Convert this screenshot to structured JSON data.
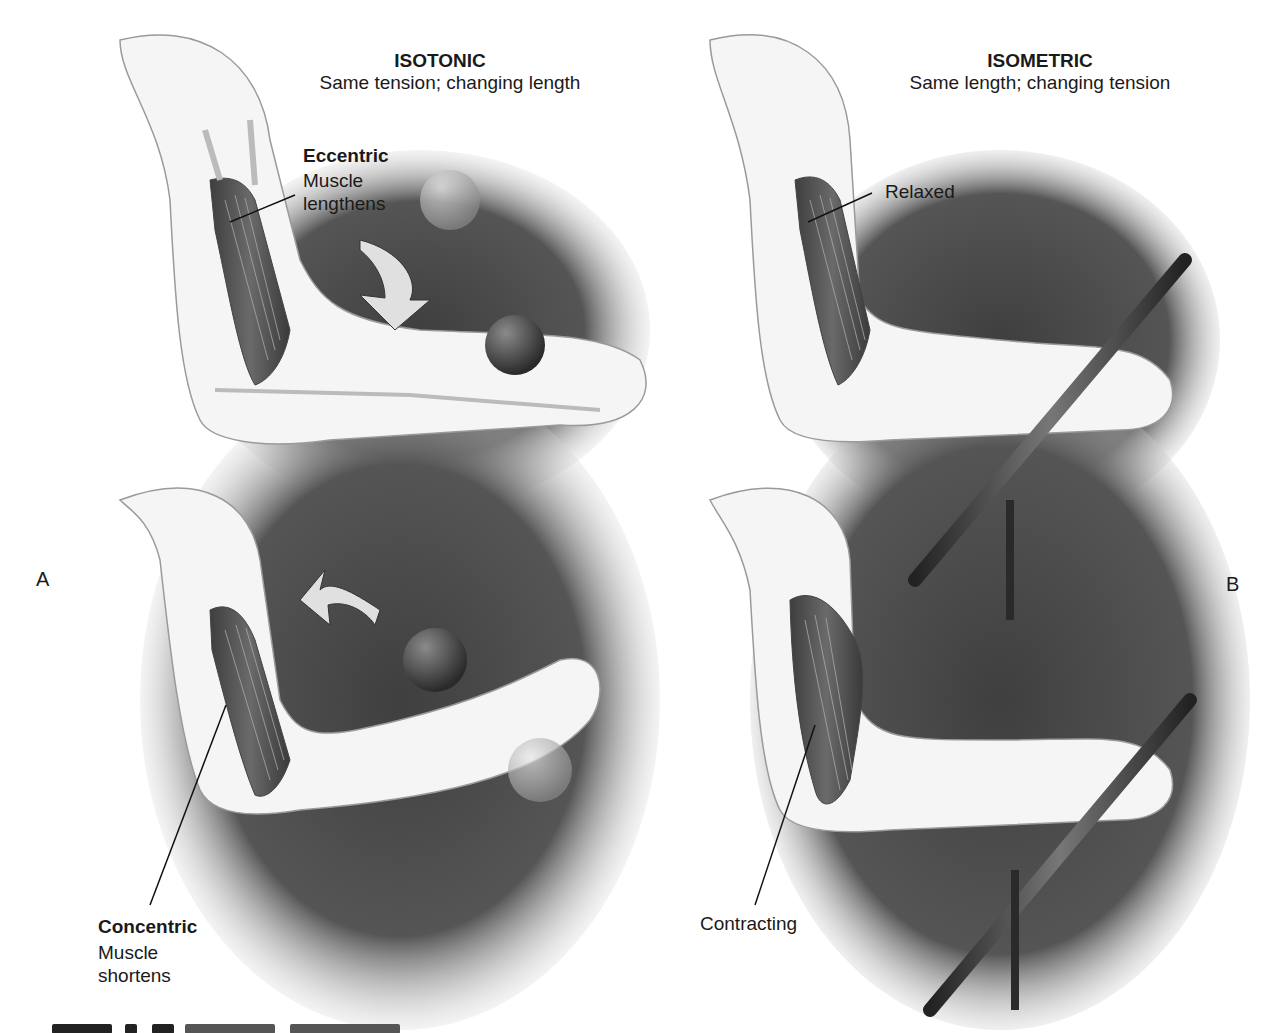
{
  "figure": {
    "panels": [
      {
        "letter": "A",
        "title": "ISOTONIC",
        "subtitle": "Same tension; changing length",
        "callouts": [
          {
            "heading": "Eccentric",
            "line1": "Muscle",
            "line2": "lengthens"
          },
          {
            "heading": "Concentric",
            "line1": "Muscle",
            "line2": "shortens"
          }
        ]
      },
      {
        "letter": "B",
        "title": "ISOMETRIC",
        "subtitle": "Same length; changing tension",
        "callouts": [
          {
            "label": "Relaxed"
          },
          {
            "label": "Contracting"
          }
        ]
      }
    ],
    "caption": {
      "visible": "partially cut off at bottom edge"
    },
    "colors": {
      "background": "#ffffff",
      "shadow": "#4a4a4a",
      "muscle": "#5a5a5a",
      "skin": "#f4f4f4",
      "outline": "#9a9a9a",
      "text": "#1a1a1a"
    }
  }
}
